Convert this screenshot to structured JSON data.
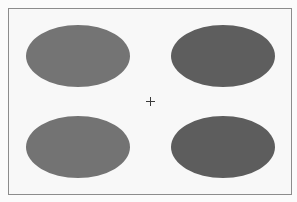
{
  "scene": {
    "background": "#fbfbfb",
    "frame": {
      "left": 8,
      "top": 8,
      "width": 282,
      "height": 185,
      "border_color": "#8c8c8c",
      "fill": "#f8f8f8"
    },
    "fixation_cross": {
      "x": 150,
      "y": 101,
      "arm": 4,
      "color": "#3a3a3a",
      "glyph": "+"
    },
    "ellipses": [
      {
        "position": "top-left",
        "cx": 78,
        "cy": 56,
        "rx": 52,
        "ry": 31,
        "color": "#747474"
      },
      {
        "position": "top-right",
        "cx": 223,
        "cy": 56,
        "rx": 52,
        "ry": 31,
        "color": "#5e5e5e"
      },
      {
        "position": "bottom-left",
        "cx": 78,
        "cy": 147,
        "rx": 52,
        "ry": 31,
        "color": "#737373"
      },
      {
        "position": "bottom-right",
        "cx": 223,
        "cy": 147,
        "rx": 52,
        "ry": 31,
        "color": "#5d5d5d"
      }
    ]
  }
}
